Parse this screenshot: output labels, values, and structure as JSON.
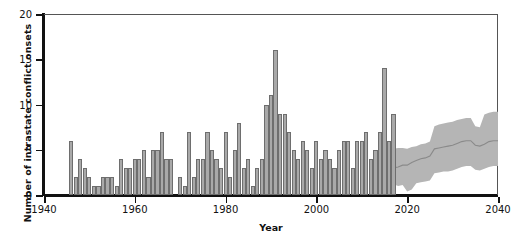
{
  "chart_data": {
    "type": "bar",
    "title": "",
    "xlabel": "Year",
    "ylabel": "Number of intrastate conflict onsets",
    "xlim": [
      1940,
      2040
    ],
    "ylim": [
      0,
      20
    ],
    "xticks": [
      1940,
      1960,
      1980,
      2000,
      2020,
      2040
    ],
    "yticks": [
      0,
      5,
      10,
      15,
      20
    ],
    "grid": false,
    "legend": null,
    "series": [
      {
        "name": "Historical intrastate conflict onsets",
        "type": "bar",
        "x": [
          1946,
          1947,
          1948,
          1949,
          1950,
          1951,
          1952,
          1953,
          1954,
          1955,
          1956,
          1957,
          1958,
          1959,
          1960,
          1961,
          1962,
          1963,
          1964,
          1965,
          1966,
          1967,
          1968,
          1969,
          1970,
          1971,
          1972,
          1973,
          1974,
          1975,
          1976,
          1977,
          1978,
          1979,
          1980,
          1981,
          1982,
          1983,
          1984,
          1985,
          1986,
          1987,
          1988,
          1989,
          1990,
          1991,
          1992,
          1993,
          1994,
          1995,
          1996,
          1997,
          1998,
          1999,
          2000,
          2001,
          2002,
          2003,
          2004,
          2005,
          2006,
          2007,
          2008,
          2009,
          2010,
          2011,
          2012,
          2013,
          2014,
          2015,
          2016,
          2017
        ],
        "values": [
          6,
          2,
          4,
          3,
          2,
          1,
          1,
          2,
          2,
          2,
          1,
          4,
          3,
          3,
          4,
          4,
          5,
          2,
          5,
          5,
          7,
          4,
          4,
          0,
          2,
          1,
          7,
          2,
          4,
          4,
          7,
          5,
          4,
          3,
          7,
          2,
          5,
          8,
          3,
          4,
          1,
          3,
          4,
          10,
          11,
          16,
          9,
          9,
          7,
          5,
          4,
          6,
          5,
          3,
          6,
          4,
          5,
          4,
          3,
          5,
          6,
          6,
          3,
          6,
          6,
          7,
          4,
          5,
          7,
          14,
          6,
          9
        ]
      },
      {
        "name": "Projected onsets (median)",
        "type": "line",
        "x": [
          2017,
          2018,
          2019,
          2020,
          2021,
          2022,
          2023,
          2024,
          2025,
          2026,
          2027,
          2028,
          2029,
          2030,
          2031,
          2032,
          2033,
          2034,
          2035,
          2036,
          2037,
          2038,
          2039,
          2040
        ],
        "values": [
          3.0,
          3.1,
          3.3,
          3.3,
          3.6,
          3.8,
          4.0,
          4.1,
          4.3,
          5.1,
          5.2,
          5.3,
          5.4,
          5.5,
          5.7,
          5.9,
          6.0,
          6.0,
          5.5,
          5.4,
          5.6,
          5.9,
          6.0,
          6.0
        ]
      },
      {
        "name": "Projected onsets (uncertainty band)",
        "type": "band",
        "x": [
          2017,
          2018,
          2019,
          2020,
          2021,
          2022,
          2023,
          2024,
          2025,
          2026,
          2027,
          2028,
          2029,
          2030,
          2031,
          2032,
          2033,
          2034,
          2035,
          2036,
          2037,
          2038,
          2039,
          2040
        ],
        "lower": [
          1.2,
          1.0,
          1.1,
          0.4,
          0.6,
          1.3,
          1.4,
          1.5,
          1.6,
          2.4,
          2.5,
          2.6,
          2.6,
          2.7,
          2.9,
          3.1,
          3.2,
          3.2,
          2.8,
          2.7,
          2.9,
          3.1,
          3.2,
          3.2
        ],
        "upper": [
          5.1,
          5.2,
          5.2,
          5.1,
          5.3,
          5.4,
          5.6,
          5.7,
          5.9,
          7.6,
          7.8,
          7.9,
          8.0,
          8.1,
          8.3,
          8.4,
          8.5,
          8.5,
          7.6,
          7.5,
          8.9,
          9.1,
          9.2,
          9.2
        ]
      }
    ]
  },
  "style": {
    "bar_fill": "#a9a9a9",
    "bar_stroke": "#6e6e6e",
    "band_fill": "#b5b5b5",
    "line_color": "#8a8a8a",
    "axis_color": "#111111",
    "frame_color": "#555555"
  }
}
